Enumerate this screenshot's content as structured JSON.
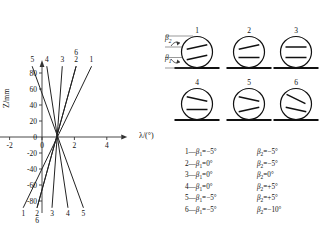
{
  "chart_data": {
    "type": "line",
    "title": "",
    "xlabel": "λ/(°)",
    "ylabel": "Z/mm",
    "xlim": [
      -3.2,
      5.2
    ],
    "ylim": [
      -95,
      95
    ],
    "xticks": [
      "-2",
      "0",
      "2",
      "4"
    ],
    "xtick_values": [
      -2,
      0,
      2,
      4
    ],
    "yticks": [
      "80",
      "60",
      "40",
      "20",
      "0",
      "-20",
      "-40",
      "-60",
      "-80"
    ],
    "ytick_values": [
      80,
      60,
      40,
      20,
      0,
      -20,
      -40,
      -60,
      -80
    ],
    "grid": false,
    "legend_position": "bottom-right",
    "series": [
      {
        "name": "1",
        "top_x": 3.05,
        "bottom_x": -1.15,
        "top_label": "1",
        "bottom_label": "1"
      },
      {
        "name": "2",
        "top_x": 2.1,
        "bottom_x": -0.3,
        "top_label": "2",
        "bottom_label": "2"
      },
      {
        "name": "3",
        "top_x": 1.25,
        "bottom_x": 0.62,
        "top_label": "3",
        "bottom_label": "3"
      },
      {
        "name": "4",
        "top_x": 0.3,
        "bottom_x": 1.6,
        "top_label": "4",
        "bottom_label": "4"
      },
      {
        "name": "5",
        "top_x": -0.6,
        "bottom_x": 2.55,
        "top_label": "5",
        "bottom_label": "5"
      },
      {
        "name": "6",
        "top_x": 2.1,
        "bottom_x": -0.3,
        "top_label": "6",
        "bottom_label": "6"
      }
    ],
    "top_tick_labels": [
      "5",
      "4",
      "3",
      "6",
      "2",
      "1"
    ],
    "bottom_tick_labels": [
      "1",
      "2",
      "6",
      "3",
      "4",
      "5"
    ],
    "crossing_point": {
      "x": 1.0,
      "y": 0
    }
  },
  "inset": {
    "angle_labels": {
      "beta2": "β",
      "beta2_sub": "2",
      "beta1": "β",
      "beta1_sub": "1"
    },
    "cases": [
      {
        "num": "1",
        "upper_deg": -12,
        "lower_deg": -12
      },
      {
        "num": "2",
        "upper_deg": -12,
        "lower_deg": 0
      },
      {
        "num": "3",
        "upper_deg": 0,
        "lower_deg": 0
      },
      {
        "num": "4",
        "upper_deg": 12,
        "lower_deg": 0
      },
      {
        "num": "5",
        "upper_deg": 12,
        "lower_deg": -12
      },
      {
        "num": "6",
        "upper_deg": 26,
        "lower_deg": 12
      }
    ]
  },
  "legend": {
    "symbol_beta": "β",
    "sub1": "1",
    "sub2": "2",
    "deg": "°",
    "rows": [
      {
        "index": "1",
        "dash": "—",
        "left": "β₁=−5°",
        "right": "β₂=−5°",
        "left_val": "−5",
        "right_val": "−5"
      },
      {
        "index": "2",
        "dash": "—",
        "left": "β₁=0°",
        "right": "β₂=−5°",
        "left_val": "0",
        "right_val": "−5"
      },
      {
        "index": "3",
        "dash": "—",
        "left": "β₁=0°",
        "right": "β₂=0°",
        "left_val": "0",
        "right_val": "0"
      },
      {
        "index": "4",
        "dash": "—",
        "left": "β₁=0°",
        "right": "β₂=+5°",
        "left_val": "0",
        "right_val": "+5"
      },
      {
        "index": "5",
        "dash": "—",
        "left": "β₁=−5°",
        "right": "β₂=+5°",
        "left_val": "−5",
        "right_val": "+5"
      },
      {
        "index": "6",
        "dash": "—",
        "left": "β₁=−5°",
        "right": "β₂=−10°",
        "left_val": "−5",
        "right_val": "−10"
      }
    ]
  }
}
